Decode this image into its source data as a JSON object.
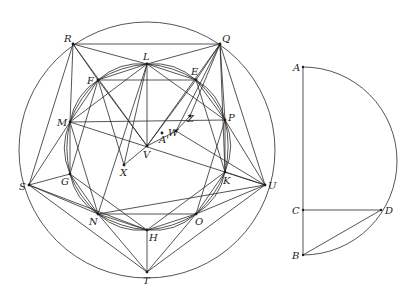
{
  "figure": {
    "left": {
      "description": "Circle with inscribed polygon construction and inner arc-gon",
      "outer_circle": {
        "cx": 147,
        "cy": 150,
        "r": 128
      },
      "points": {
        "R": {
          "x": 73,
          "y": 44,
          "label": "R",
          "lx": 64,
          "ly": 42
        },
        "Q": {
          "x": 220,
          "y": 44,
          "label": "Q",
          "lx": 222,
          "ly": 42
        },
        "L": {
          "x": 147,
          "y": 64,
          "label": "L",
          "lx": 143,
          "ly": 60
        },
        "F": {
          "x": 98,
          "y": 80,
          "label": "F",
          "lx": 87,
          "ly": 84
        },
        "E": {
          "x": 196,
          "y": 80,
          "label": "E",
          "lx": 191,
          "ly": 75
        },
        "M": {
          "x": 70,
          "y": 122,
          "label": "M",
          "lx": 57,
          "ly": 126
        },
        "P": {
          "x": 225,
          "y": 120,
          "label": "P",
          "lx": 228,
          "ly": 121
        },
        "G": {
          "x": 70,
          "y": 174,
          "label": "G",
          "lx": 61,
          "ly": 185
        },
        "K": {
          "x": 225,
          "y": 172,
          "label": "K",
          "lx": 223,
          "ly": 184
        },
        "S": {
          "x": 29,
          "y": 185,
          "label": "S",
          "lx": 19,
          "ly": 190
        },
        "U": {
          "x": 265,
          "y": 185,
          "label": "U",
          "lx": 268,
          "ly": 189
        },
        "N": {
          "x": 98,
          "y": 214,
          "label": "N",
          "lx": 89,
          "ly": 225
        },
        "O": {
          "x": 196,
          "y": 214,
          "label": "O",
          "lx": 195,
          "ly": 225
        },
        "H": {
          "x": 147,
          "y": 230,
          "label": "H",
          "lx": 149,
          "ly": 241
        },
        "T": {
          "x": 147,
          "y": 272,
          "label": "T",
          "lx": 143,
          "ly": 284
        },
        "V": {
          "x": 147,
          "y": 146,
          "label": "V",
          "lx": 143,
          "ly": 158
        },
        "X": {
          "x": 124,
          "y": 165,
          "label": "X",
          "lx": 120,
          "ly": 176
        },
        "W": {
          "x": 176,
          "y": 131,
          "label": "W",
          "lx": 168,
          "ly": 136
        },
        "Z": {
          "x": 190,
          "y": 116,
          "label": "Z",
          "lx": 187,
          "ly": 122
        },
        "A'": {
          "x": 162,
          "y": 133,
          "label": "A'",
          "lx": 159,
          "ly": 143
        }
      },
      "segments": [
        [
          "R",
          "Q"
        ],
        [
          "R",
          "L"
        ],
        [
          "L",
          "Q"
        ],
        [
          "R",
          "F"
        ],
        [
          "R",
          "M"
        ],
        [
          "R",
          "S"
        ],
        [
          "R",
          "V"
        ],
        [
          "Q",
          "E"
        ],
        [
          "Q",
          "P"
        ],
        [
          "Q",
          "U"
        ],
        [
          "Q",
          "V"
        ],
        [
          "Q",
          "W"
        ],
        [
          "Q",
          "Z"
        ],
        [
          "Q",
          "K"
        ],
        [
          "F",
          "E"
        ],
        [
          "F",
          "L"
        ],
        [
          "L",
          "E"
        ],
        [
          "L",
          "V"
        ],
        [
          "L",
          "N"
        ],
        [
          "L",
          "M"
        ],
        [
          "L",
          "P"
        ],
        [
          "F",
          "M"
        ],
        [
          "F",
          "G"
        ],
        [
          "F",
          "V"
        ],
        [
          "E",
          "P"
        ],
        [
          "E",
          "K"
        ],
        [
          "E",
          "V"
        ],
        [
          "M",
          "G"
        ],
        [
          "M",
          "N"
        ],
        [
          "M",
          "S"
        ],
        [
          "M",
          "U"
        ],
        [
          "M",
          "P"
        ],
        [
          "P",
          "K"
        ],
        [
          "P",
          "U"
        ],
        [
          "P",
          "O"
        ],
        [
          "G",
          "S"
        ],
        [
          "G",
          "N"
        ],
        [
          "G",
          "H"
        ],
        [
          "K",
          "U"
        ],
        [
          "K",
          "O"
        ],
        [
          "K",
          "H"
        ],
        [
          "S",
          "N"
        ],
        [
          "S",
          "T"
        ],
        [
          "S",
          "H"
        ],
        [
          "U",
          "O"
        ],
        [
          "U",
          "T"
        ],
        [
          "U",
          "N"
        ],
        [
          "N",
          "O"
        ],
        [
          "N",
          "H"
        ],
        [
          "O",
          "H"
        ],
        [
          "N",
          "T"
        ],
        [
          "O",
          "T"
        ],
        [
          "H",
          "T"
        ],
        [
          "X",
          "V"
        ],
        [
          "X",
          "L"
        ],
        [
          "X",
          "F"
        ],
        [
          "V",
          "W"
        ],
        [
          "W",
          "Z"
        ],
        [
          "W",
          "U"
        ]
      ]
    },
    "right": {
      "description": "Semicircle on diameter AB with perpendicular CD and chord BD",
      "points": {
        "A": {
          "x": 303,
          "y": 67,
          "label": "A",
          "lx": 293,
          "ly": 71
        },
        "C": {
          "x": 303,
          "y": 210,
          "label": "C",
          "lx": 292,
          "ly": 214
        },
        "B": {
          "x": 303,
          "y": 255,
          "label": "B",
          "lx": 292,
          "ly": 259
        },
        "D": {
          "x": 381,
          "y": 210,
          "label": "D",
          "lx": 385,
          "ly": 214
        }
      },
      "segments": [
        [
          "A",
          "B"
        ],
        [
          "C",
          "D"
        ],
        [
          "B",
          "D"
        ]
      ],
      "semicircle": {
        "cx": 303,
        "cy": 161,
        "r": 94
      }
    }
  }
}
